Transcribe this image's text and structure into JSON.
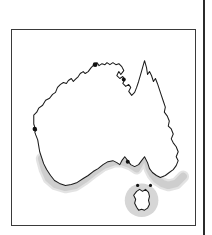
{
  "figure": {
    "subject": "Australia",
    "map_type": "species-distribution-outline-map",
    "caption": "",
    "title": "",
    "alt_text": "Outline map of Australia with a grey shaded band along the southern and south-eastern coastline including Tasmania",
    "frame": {
      "border_color": "#3a3a3a",
      "background": "#ffffff",
      "x": 11,
      "y": 29,
      "width": 185,
      "height": 197
    },
    "page_rule": {
      "name": "column-rule",
      "color": "#2b2b2b",
      "x": 203,
      "width": 2
    }
  },
  "map": {
    "landmass_label": "Australia",
    "outline_color": "#1a1a1a",
    "land_fill": "#ffffff",
    "shading": {
      "label": "distribution range",
      "color": "#cccccc",
      "halo_color": "#dedede",
      "regions": [
        "south-west coast",
        "Great Australian Bight",
        "south-east coast",
        "Tasmania"
      ]
    },
    "islands": [
      {
        "name": "Tasmania",
        "shaded": true
      }
    ],
    "markers": [
      {
        "name": "west-coast-marker"
      },
      {
        "name": "north-coast-marker"
      },
      {
        "name": "gulf-marker"
      }
    ],
    "legend": [],
    "scale_bar": null,
    "north_arrow": null,
    "labels": []
  }
}
